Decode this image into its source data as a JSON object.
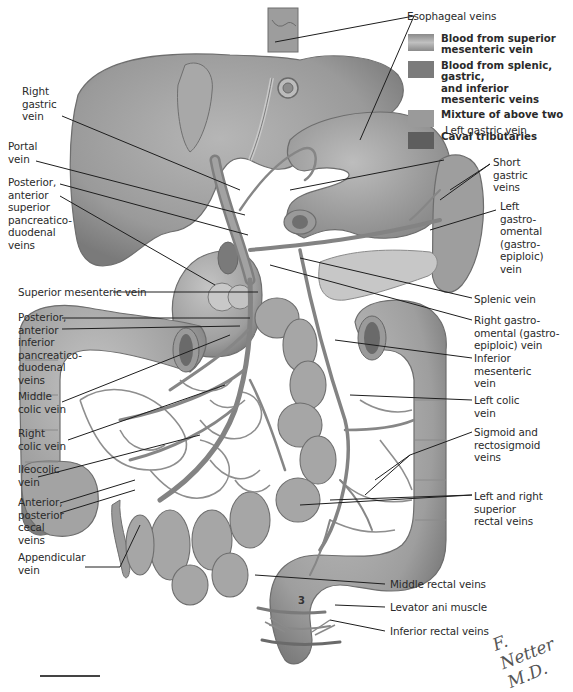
{
  "figure": {
    "plate_number": "3",
    "signature": "F. Netter M.D."
  },
  "legend": {
    "items": [
      {
        "label": "Blood from superior\nmesenteric vein",
        "color": "#8a8a8a"
      },
      {
        "label": "Blood from splenic, gastric,\nand inferior mesenteric veins",
        "color": "#7b7b7b"
      },
      {
        "label": "Mixture of above two",
        "color": "#9a9a9a"
      },
      {
        "label": "Caval tributaries",
        "color": "#5e5e5e"
      }
    ]
  },
  "labels": {
    "left": [
      {
        "id": "right-gastric-vein",
        "text": "Right\ngastric\nvein"
      },
      {
        "id": "portal-vein",
        "text": "Portal\nvein"
      },
      {
        "id": "post-ant-sup-pancreaticoduodenal",
        "text": "Posterior,\nanterior\nsuperior\npancreatico-\nduodenal\nveins"
      },
      {
        "id": "superior-mesenteric-vein",
        "text": "Superior mesenteric vein"
      },
      {
        "id": "post-ant-inf-pancreaticoduodenal",
        "text": "Posterior,\nanterior\ninferior\npancreatico-\nduodenal\nveins"
      },
      {
        "id": "middle-colic-vein",
        "text": "Middle\ncolic vein"
      },
      {
        "id": "right-colic-vein",
        "text": "Right\ncolic vein"
      },
      {
        "id": "ileocolic-vein",
        "text": "Ileocolic\nvein"
      },
      {
        "id": "cecal-veins",
        "text": "Anterior,\nposterior\ncecal\nveins"
      },
      {
        "id": "appendicular-vein",
        "text": "Appendicular\nvein"
      }
    ],
    "right": [
      {
        "id": "esophageal-veins",
        "text": "Esophageal veins"
      },
      {
        "id": "left-gastric-vein",
        "text": "Left gastric vein"
      },
      {
        "id": "short-gastric-veins",
        "text": "Short\ngastric\nveins"
      },
      {
        "id": "left-gastroomental-vein",
        "text": "Left\ngastro-\nomental\n(gastro-\nepiploic)\nvein"
      },
      {
        "id": "splenic-vein",
        "text": "Splenic vein"
      },
      {
        "id": "right-gastroomental-vein",
        "text": "Right gastro-\nomental (gastro-\nepiploic) vein"
      },
      {
        "id": "inferior-mesenteric-vein",
        "text": "Inferior\nmesenteric\nvein"
      },
      {
        "id": "left-colic-vein",
        "text": "Left colic\nvein"
      },
      {
        "id": "sigmoid-rectosigmoid-veins",
        "text": "Sigmoid and\nrectosigmoid\nveins"
      },
      {
        "id": "superior-rectal-veins",
        "text": "Left and right\nsuperior\nrectal veins"
      },
      {
        "id": "middle-rectal-veins",
        "text": "Middle rectal veins"
      },
      {
        "id": "levator-ani-muscle",
        "text": "Levator ani muscle"
      },
      {
        "id": "inferior-rectal-veins",
        "text": "Inferior rectal veins"
      }
    ]
  },
  "colors": {
    "organ_fill": "#a9a9a9",
    "organ_dark": "#7d7d7d",
    "organ_light": "#c8c8c8",
    "vein": "#8c8c8c",
    "leader_line": "#1e1e1e"
  }
}
